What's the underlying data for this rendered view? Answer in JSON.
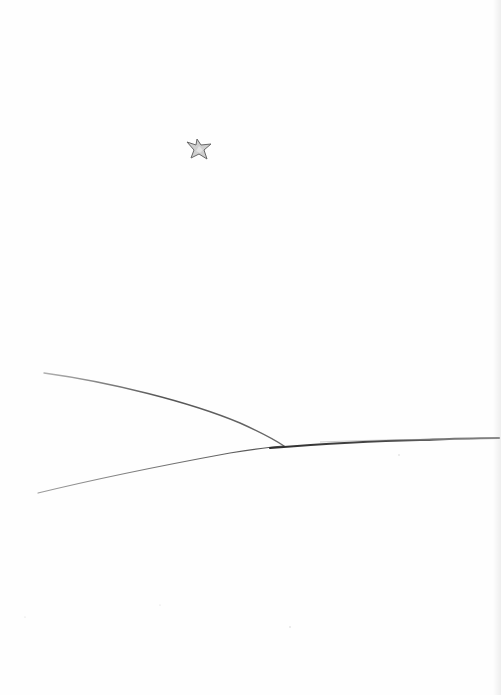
{
  "image": {
    "description": "Pencil sketch on white paper: a small shaded star in the sky and converging lines meeting a horizon line",
    "width": 501,
    "height": 695,
    "colors": {
      "paper": "#fefefe",
      "pencil_dark": "#3a3a3a",
      "pencil_light": "#7a7a7a",
      "star_fill": "#c9c9c9",
      "star_stroke": "#6b6b6b",
      "edge_shadow": "#e1e1e1"
    },
    "elements": {
      "star": {
        "cx": 200,
        "cy": 149,
        "size": 13
      },
      "upper_line": {
        "from": [
          44,
          373
        ],
        "to": [
          283,
          446
        ]
      },
      "lower_line": {
        "from": [
          38,
          493
        ],
        "to": [
          283,
          446
        ]
      },
      "horizon_line": {
        "from": [
          283,
          446
        ],
        "to": [
          498,
          438
        ]
      }
    }
  }
}
